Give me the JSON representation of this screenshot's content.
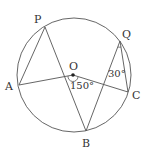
{
  "diagram": {
    "type": "circle-geometry",
    "circle": {
      "cx": 74,
      "cy": 75,
      "r": 57
    },
    "points": {
      "O": {
        "label": "O",
        "x": 73,
        "y": 75
      },
      "P": {
        "label": "P",
        "x": 45,
        "y": 27
      },
      "A": {
        "label": "A",
        "x": 19,
        "y": 85
      },
      "B": {
        "label": "B",
        "x": 86,
        "y": 131
      },
      "C": {
        "label": "C",
        "x": 128,
        "y": 92
      },
      "Q": {
        "label": "Q",
        "x": 120,
        "y": 41
      }
    },
    "segments": [
      "PA",
      "PB",
      "AO",
      "OC",
      "QB",
      "QC"
    ],
    "angles": {
      "AOC": {
        "label": "150°"
      },
      "BQC": {
        "label": "30°"
      }
    },
    "stroke_color": "#555555"
  }
}
